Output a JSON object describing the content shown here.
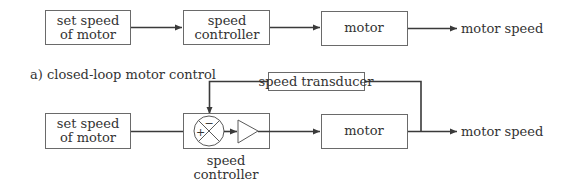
{
  "open_loop": {
    "set_speed_line1": "set speed",
    "set_speed_line2": "of motor",
    "controller_line1": "speed",
    "controller_line2": "controller",
    "motor": "motor",
    "output": "motor speed"
  },
  "caption": "a) closed-loop motor control",
  "closed_loop": {
    "set_speed_line1": "set speed",
    "set_speed_line2": "of motor",
    "transducer": "speed transducer",
    "plus_sign": "+",
    "minus_sign": "−",
    "motor": "motor",
    "output": "motor speed",
    "controller_line1": "speed",
    "controller_line2": "controller"
  },
  "colors": {
    "line": "#3a3a3a",
    "box_border": "#6a6a6a",
    "text": "#333333"
  }
}
